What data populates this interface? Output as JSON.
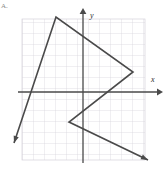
{
  "figure": {
    "item_label": "A.",
    "background_color": "#ffffff",
    "grid": {
      "color": "#c9c6cf",
      "minor_color": "#d9d6de",
      "cell_size": 11,
      "x_min": 22,
      "x_max": 145,
      "y_min": 19,
      "y_max": 160,
      "visible": true
    },
    "axes": {
      "x_label": "x",
      "y_label": "y",
      "color": "#4a4a4a",
      "x_axis_y": 92,
      "y_axis_x": 83,
      "x_axis_start": 18,
      "x_axis_end": 159,
      "y_axis_start": 162,
      "y_axis_end": 11,
      "x_label_pos": {
        "x": 151,
        "y": 82
      },
      "y_label_pos": {
        "x": 90,
        "y": 18
      },
      "arrowheads": [
        "x-positive",
        "y-positive"
      ]
    },
    "polyline": {
      "name": "zigzag-path",
      "color": "#4a4a4a",
      "stroke_width": 1.6,
      "arrow_start": true,
      "arrow_end": true,
      "points_px": [
        {
          "x": 14,
          "y": 143
        },
        {
          "x": 56,
          "y": 17
        },
        {
          "x": 133,
          "y": 72
        },
        {
          "x": 69,
          "y": 122
        },
        {
          "x": 148,
          "y": 160
        }
      ],
      "points_graph": [
        {
          "x": -6.3,
          "y": -4.6
        },
        {
          "x": -2.5,
          "y": 6.8
        },
        {
          "x": 4.5,
          "y": 1.8
        },
        {
          "x": -1.3,
          "y": -2.7
        },
        {
          "x": 5.9,
          "y": -6.2
        }
      ]
    }
  }
}
